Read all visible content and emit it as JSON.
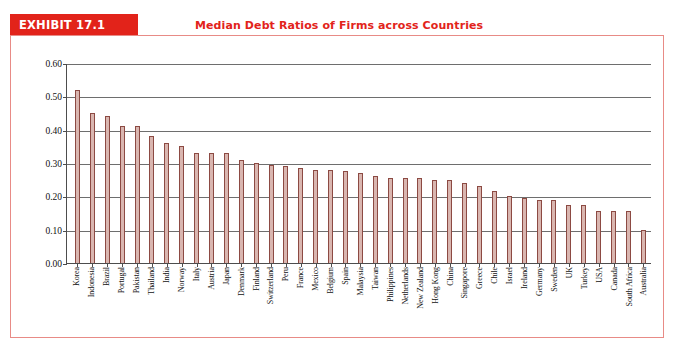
{
  "exhibit": {
    "label": "EXHIBIT 17.1",
    "title": "Median Debt Ratios of Firms across Countries"
  },
  "colors": {
    "banner": "#e2231a",
    "title": "#e2231a",
    "panel_border": "#e88b86",
    "bar_fill": "#d9b6b0",
    "bar_border": "#8c4a43",
    "gridline": "#6e6e6e",
    "axis": "#4d4d4d"
  },
  "chart_data": {
    "type": "bar",
    "title": "Median Debt Ratios of Firms across Countries",
    "xlabel": "",
    "ylabel": "",
    "ylim": [
      0.0,
      0.6
    ],
    "ytick_labels": [
      "0.00",
      "0.10",
      "0.20",
      "0.30",
      "0.40",
      "0.50",
      "0.60"
    ],
    "ytick_values": [
      0.0,
      0.1,
      0.2,
      0.3,
      0.4,
      0.5,
      0.6
    ],
    "grid": true,
    "legend": "none",
    "orientation": "vertical",
    "categories": [
      "Korea",
      "Indonesia",
      "Brazil",
      "Portugal",
      "Pakistan",
      "Thailand",
      "India",
      "Norway",
      "Italy",
      "Austria",
      "Japan",
      "Denmark",
      "Finland",
      "Switzerland",
      "Peru",
      "France",
      "Mexico",
      "Belgium",
      "Spain",
      "Malaysia",
      "Taiwan",
      "Philippines",
      "Netherlands",
      "New Zealand",
      "Hong Kong",
      "China",
      "Singapore",
      "Greece",
      "Chile",
      "Israel",
      "Ireland",
      "Germany",
      "Sweden",
      "UK",
      "Turkey",
      "USA",
      "Canada",
      "South Africa",
      "Australia"
    ],
    "values": [
      0.52,
      0.45,
      0.44,
      0.41,
      0.41,
      0.38,
      0.36,
      0.35,
      0.33,
      0.33,
      0.33,
      0.31,
      0.3,
      0.295,
      0.29,
      0.285,
      0.28,
      0.28,
      0.275,
      0.27,
      0.26,
      0.255,
      0.255,
      0.255,
      0.25,
      0.25,
      0.24,
      0.23,
      0.215,
      0.2,
      0.195,
      0.19,
      0.19,
      0.175,
      0.175,
      0.155,
      0.155,
      0.155,
      0.1
    ]
  }
}
